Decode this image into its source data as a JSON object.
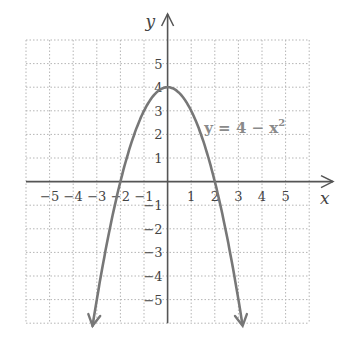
{
  "chart_data": {
    "type": "line",
    "title": "",
    "xlabel": "x",
    "ylabel": "y",
    "xlim": [
      -6,
      6
    ],
    "ylim": [
      -6,
      6
    ],
    "grid": true,
    "x_ticks": [
      -5,
      -4,
      -3,
      -2,
      -1,
      1,
      2,
      3,
      4,
      5
    ],
    "y_ticks": [
      -5,
      -4,
      -3,
      -2,
      -1,
      1,
      2,
      3,
      4,
      5
    ],
    "x_tick_labels": [
      "−5",
      "−4",
      "−3",
      "−2",
      "−1",
      "1",
      "2",
      "3",
      "4",
      "5"
    ],
    "y_tick_labels": [
      "−5",
      "−4",
      "−3",
      "−2",
      "−1",
      "1",
      "2",
      "3",
      "4",
      "5"
    ],
    "series": [
      {
        "name": "y = 4 − x²",
        "function": "4 - x^2",
        "x": [
          -3.2,
          -3,
          -2.5,
          -2,
          -1.5,
          -1,
          -0.5,
          0,
          0.5,
          1,
          1.5,
          2,
          2.5,
          3,
          3.2
        ],
        "y": [
          -6.24,
          -5,
          -2.25,
          0,
          1.75,
          3,
          3.75,
          4,
          3.75,
          3,
          1.75,
          0,
          -2.25,
          -5,
          -6.24
        ],
        "arrows_at_ends": true,
        "color": "#777777"
      }
    ],
    "annotations": [
      {
        "text": "y = 4 − x²",
        "x": 1.55,
        "y": 2.05
      }
    ],
    "key_points": {
      "vertex": [
        0,
        4
      ],
      "x_intercepts": [
        [
          -2,
          0
        ],
        [
          2,
          0
        ]
      ]
    }
  },
  "labels": {
    "x_axis": "x",
    "y_axis": "y",
    "equation_prefix": "y = 4 − x",
    "equation_exp": "2"
  },
  "colors": {
    "curve": "#777777",
    "axis": "#555555",
    "grid": "#b5b5b5",
    "text": "#444444"
  }
}
